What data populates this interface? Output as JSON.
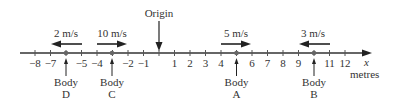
{
  "diagram": {
    "origin_label": "Origin",
    "axis_var": "x",
    "unit_label": "metres",
    "ticks": [
      -8,
      -7,
      -5,
      -4,
      -2,
      -1,
      1,
      2,
      3,
      4,
      6,
      7,
      8,
      9,
      11,
      12
    ],
    "tick_labels": [
      "−8",
      "−7",
      "−5",
      "−4",
      "−2",
      "−1",
      "1",
      "2",
      "3",
      "4",
      "6",
      "7",
      "8",
      "9",
      "11",
      "12"
    ],
    "bodies": [
      {
        "name": "Body",
        "letter": "D",
        "position": -5.5,
        "speed": "2 m/s",
        "direction": "left"
      },
      {
        "name": "Body",
        "letter": "C",
        "position": -2.5,
        "speed": "10 m/s",
        "direction": "right"
      },
      {
        "name": "Body",
        "letter": "A",
        "position": 4.5,
        "speed": "5 m/s",
        "direction": "right"
      },
      {
        "name": "Body",
        "letter": "B",
        "position": 10,
        "speed": "3 m/s",
        "direction": "left"
      }
    ]
  }
}
